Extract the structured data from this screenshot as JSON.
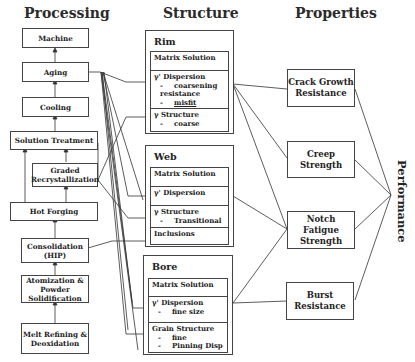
{
  "headers": {
    "processing": "Processing",
    "structure": "Structure",
    "properties": "Properties",
    "performance": "Performance"
  },
  "processing": {
    "steps": [
      {
        "id": "machine",
        "label": "Machine"
      },
      {
        "id": "aging",
        "label": "Aging"
      },
      {
        "id": "cooling",
        "label": "Cooling"
      },
      {
        "id": "solution_treatment",
        "label": "Solution Treatment"
      },
      {
        "id": "graded_recrystallization",
        "label": "Graded Recrystallization"
      },
      {
        "id": "hot_forging",
        "label": "Hot Forging"
      },
      {
        "id": "consolidation",
        "label": "Consolidation (HIP)"
      },
      {
        "id": "atomization",
        "label": "Atomization & Powder Solidification"
      },
      {
        "id": "melt_refining",
        "label": "Melt Refining & Deoxidation"
      }
    ]
  },
  "structure": {
    "groups": [
      {
        "title": "Rim",
        "cells": [
          {
            "title": "Matrix Solution",
            "items": []
          },
          {
            "title": "γ' Dispersion",
            "items": [
              "coarsening resistance",
              "misfit"
            ]
          },
          {
            "title": "γ Structure",
            "items": [
              "coarse"
            ]
          }
        ]
      },
      {
        "title": "Web",
        "cells": [
          {
            "title": "Matrix Solution",
            "items": []
          },
          {
            "title": "γ' Dispersion",
            "items": []
          },
          {
            "title": "γ Structure",
            "items": [
              "Transitional"
            ]
          },
          {
            "title": "Inclusions",
            "items": []
          }
        ]
      },
      {
        "title": "Bore",
        "cells": [
          {
            "title": "Matrix Solution",
            "items": []
          },
          {
            "title": "γ' Dispersion",
            "items": [
              "fine size"
            ]
          },
          {
            "title": "Grain Structure",
            "items": [
              "fine",
              "Pinning Disp"
            ]
          }
        ]
      }
    ]
  },
  "properties": {
    "items": [
      {
        "label": "Crack Growth Resistance"
      },
      {
        "label": "Creep Strength"
      },
      {
        "label": "Notch Fatigue Strength"
      },
      {
        "label": "Burst Resistance"
      }
    ]
  },
  "bullet": "-",
  "colors": {
    "line": "#333333",
    "border": "#444444",
    "text": "#222222"
  }
}
